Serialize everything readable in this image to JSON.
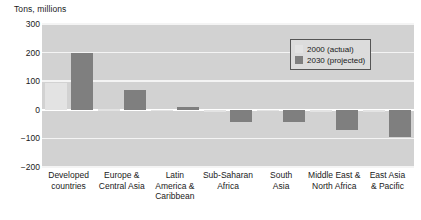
{
  "chart_data": {
    "type": "bar",
    "title": "Tons, millions",
    "xlabel": "",
    "ylabel": "Tons, millions",
    "ylim": [
      -200,
      300
    ],
    "yticks": [
      300,
      200,
      100,
      0,
      -100,
      -200
    ],
    "grid": true,
    "legend_position": "top-right",
    "categories": [
      "Developed countries",
      "Europe & Central Asia",
      "Latin America & Caribbean",
      "Sub-Saharan Africa",
      "South Asia",
      "Middle East & North Africa",
      "East Asia & Pacific"
    ],
    "series": [
      {
        "name": "2000 (actual)",
        "values": [
          92,
          2,
          -4,
          -6,
          -3,
          -8,
          -6
        ]
      },
      {
        "name": "2030 (projected)",
        "values": [
          198,
          70,
          11,
          -42,
          -43,
          -72,
          -95
        ]
      }
    ]
  },
  "axis": {
    "title": "Tons, millions",
    "yticks": [
      "300",
      "200",
      "100",
      "0",
      "-100",
      "-200"
    ],
    "xlabels": [
      [
        "Developed",
        "countries"
      ],
      [
        "Europe &",
        "Central Asia"
      ],
      [
        "Latin",
        "America &",
        "Caribbean"
      ],
      [
        "Sub-Saharan",
        "Africa"
      ],
      [
        "South",
        "Asia"
      ],
      [
        "Middle East &",
        "North Africa"
      ],
      [
        "East Asia",
        "& Pacific"
      ]
    ]
  },
  "legend": {
    "items": [
      {
        "label": "2000 (actual)",
        "color": "#e3e3e3"
      },
      {
        "label": "2030 (projected)",
        "color": "#7f7f7f"
      }
    ]
  },
  "colors": {
    "plot_background": "#d2d2d2",
    "gridline": "#f4f4f4",
    "zeroline": "#ffffff",
    "series_2000": "#e3e3e3",
    "series_2030": "#7f7f7f",
    "text": "#1a1a1a"
  }
}
